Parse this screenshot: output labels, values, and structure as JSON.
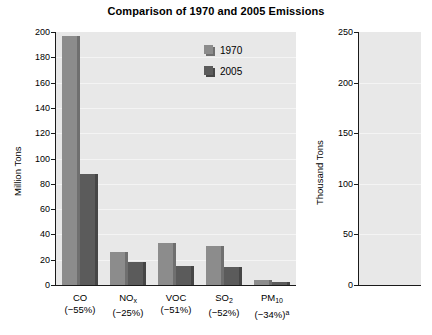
{
  "chart_data": [
    {
      "type": "bar",
      "id": "left-panel",
      "title": "Comparison of 1970 and 2005 Emissions",
      "xlabel": "",
      "ylabel": "Million Tons",
      "ylim": [
        0,
        200
      ],
      "yticks": [
        0,
        20,
        40,
        60,
        80,
        100,
        120,
        140,
        160,
        180,
        200
      ],
      "ytick_labels": [
        "0",
        "20",
        "40",
        "60",
        "80",
        "100",
        "120",
        "140",
        "160",
        "180",
        "200"
      ],
      "grid": true,
      "legend": [
        "1970",
        "2005"
      ],
      "legend_position": "upper right",
      "categories": [
        "CO",
        "NOx",
        "VOC",
        "SO2",
        "PM10"
      ],
      "category_labels": [
        {
          "name": "CO",
          "sub": "",
          "sup": "",
          "pct": "(−55%)"
        },
        {
          "name": "NO",
          "sub": "x",
          "sup": "",
          "pct": "(−25%)"
        },
        {
          "name": "VOC",
          "sub": "",
          "sup": "",
          "pct": "(−51%)"
        },
        {
          "name": "SO",
          "sub": "2",
          "sup": "",
          "pct": "(−52%)"
        },
        {
          "name": "PM",
          "sub": "10",
          "sup": "",
          "pct": "(−34%)",
          "pct_sup": "a"
        }
      ],
      "series": [
        {
          "name": "1970",
          "color": "#8c8c8c",
          "values": [
            197,
            26,
            33,
            31,
            4
          ]
        },
        {
          "name": "2005",
          "color": "#5b5b5b",
          "values": [
            88,
            18,
            15,
            14,
            2.5
          ]
        }
      ]
    },
    {
      "type": "bar",
      "id": "right-panel",
      "title": "",
      "xlabel": "",
      "ylabel": "Thousand Tons",
      "ylim": [
        0,
        250
      ],
      "yticks": [
        0,
        50,
        100,
        150,
        200,
        250
      ],
      "ytick_labels": [
        "0",
        "50",
        "100",
        "150",
        "200",
        "250"
      ],
      "grid": true,
      "categories": [
        "Pb"
      ],
      "category_labels": [
        {
          "name": "Pb",
          "sub": "",
          "sup": "",
          "pct": "(−98%)",
          "pct_sup": "b"
        }
      ],
      "series": [
        {
          "name": "1970",
          "color": "#8c8c8c",
          "values": [
            219
          ]
        },
        {
          "name": "2005",
          "color": "#5b5b5b",
          "values": [
            4
          ]
        }
      ]
    }
  ],
  "colors": {
    "series_1970": "#8c8c8c",
    "series_2005": "#5b5b5b",
    "plot_background": "#e8e8e8",
    "gridline": "#f4f4f4",
    "axis": "#1a1a1a",
    "text": "#000000",
    "page_background": "#ffffff"
  }
}
